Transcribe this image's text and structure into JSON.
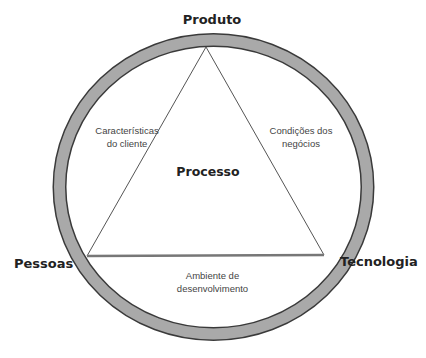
{
  "diagram": {
    "vertices": {
      "top": "Produto",
      "left": "Pessoas",
      "right": "Tecnologia"
    },
    "center": "Processo",
    "edges": {
      "left": [
        "Características",
        "do cliente"
      ],
      "right": [
        "Condições dos",
        "negócios"
      ],
      "bottom": [
        "Ambiente de",
        "desenvolvimento"
      ]
    },
    "colors": {
      "ring_fill": "#a9a9a9",
      "ring_outline": "#3a3a3a",
      "triangle_line": "#555555"
    }
  }
}
